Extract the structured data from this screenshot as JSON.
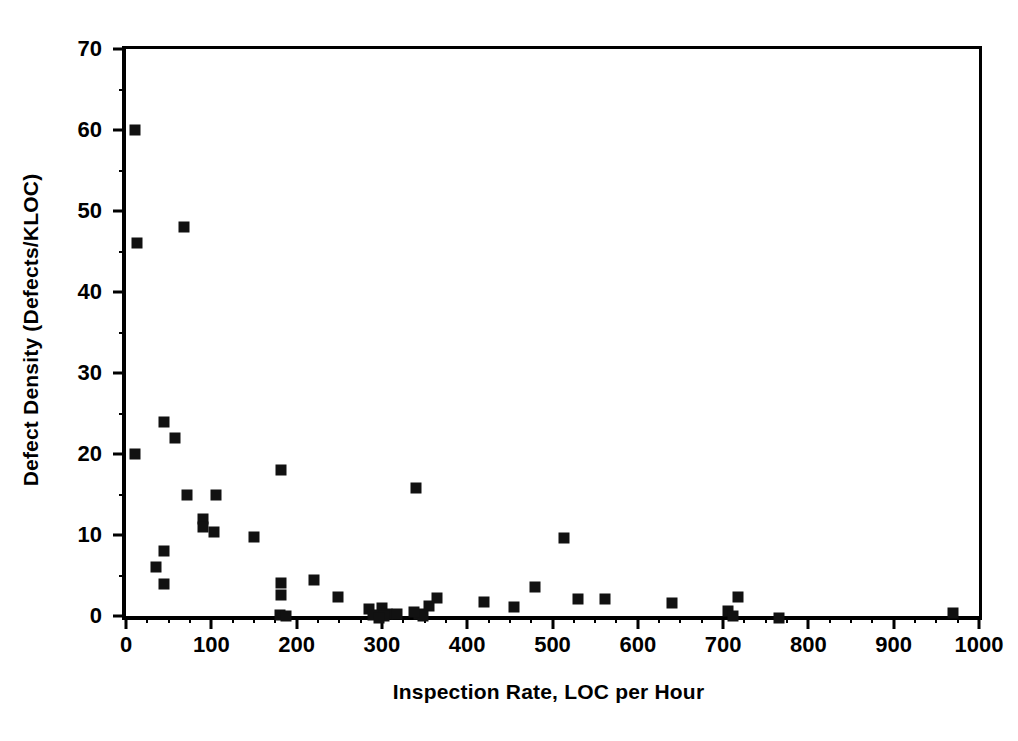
{
  "chart_data": {
    "type": "scatter",
    "title": "",
    "xlabel": "Inspection Rate, LOC per Hour",
    "ylabel": "Defect Density (Defects/KLOC)",
    "xlim": [
      0,
      1000
    ],
    "ylim": [
      0,
      70
    ],
    "x_major_ticks": [
      0,
      100,
      200,
      300,
      400,
      500,
      600,
      700,
      800,
      900,
      1000
    ],
    "x_minor_step": 25,
    "y_major_ticks": [
      0,
      10,
      20,
      30,
      40,
      50,
      60,
      70
    ],
    "y_minor_step": 5,
    "x_tick_labels": [
      "0",
      "100",
      "200",
      "300",
      "400",
      "500",
      "600",
      "700",
      "800",
      "900",
      "1000"
    ],
    "y_tick_labels": [
      "0",
      "10",
      "20",
      "30",
      "40",
      "50",
      "60",
      "70"
    ],
    "grid": false,
    "legend": false,
    "marker": "filled-square",
    "marker_color": "#111111",
    "marker_size_px": 11,
    "n_points": 47,
    "points": [
      {
        "x": 10,
        "y": 60.0
      },
      {
        "x": 13,
        "y": 46.0
      },
      {
        "x": 68,
        "y": 48.0
      },
      {
        "x": 45,
        "y": 24.0
      },
      {
        "x": 58,
        "y": 22.0
      },
      {
        "x": 10,
        "y": 20.0
      },
      {
        "x": 182,
        "y": 18.0
      },
      {
        "x": 340,
        "y": 15.8
      },
      {
        "x": 72,
        "y": 15.0
      },
      {
        "x": 105,
        "y": 15.0
      },
      {
        "x": 90,
        "y": 12.0
      },
      {
        "x": 90,
        "y": 11.0
      },
      {
        "x": 103,
        "y": 10.4
      },
      {
        "x": 150,
        "y": 9.8
      },
      {
        "x": 513,
        "y": 9.6
      },
      {
        "x": 45,
        "y": 8.0
      },
      {
        "x": 35,
        "y": 6.0
      },
      {
        "x": 45,
        "y": 4.0
      },
      {
        "x": 182,
        "y": 4.1
      },
      {
        "x": 220,
        "y": 4.4
      },
      {
        "x": 182,
        "y": 2.6
      },
      {
        "x": 248,
        "y": 2.4
      },
      {
        "x": 480,
        "y": 3.6
      },
      {
        "x": 365,
        "y": 2.2
      },
      {
        "x": 420,
        "y": 1.7
      },
      {
        "x": 455,
        "y": 1.1
      },
      {
        "x": 530,
        "y": 2.1
      },
      {
        "x": 562,
        "y": 2.1
      },
      {
        "x": 640,
        "y": 1.6
      },
      {
        "x": 718,
        "y": 2.4
      },
      {
        "x": 285,
        "y": 0.9
      },
      {
        "x": 300,
        "y": 1.0
      },
      {
        "x": 306,
        "y": 0.3
      },
      {
        "x": 318,
        "y": 0.2
      },
      {
        "x": 343,
        "y": 0.2
      },
      {
        "x": 355,
        "y": 1.2
      },
      {
        "x": 290,
        "y": 0.1
      },
      {
        "x": 302,
        "y": 0.0
      },
      {
        "x": 348,
        "y": 0.0
      },
      {
        "x": 180,
        "y": 0.1
      },
      {
        "x": 188,
        "y": 0.0
      },
      {
        "x": 706,
        "y": 0.6
      },
      {
        "x": 712,
        "y": 0.0
      },
      {
        "x": 765,
        "y": -0.3
      },
      {
        "x": 970,
        "y": 0.4
      },
      {
        "x": 297,
        "y": -0.3
      },
      {
        "x": 338,
        "y": 0.5
      }
    ]
  }
}
